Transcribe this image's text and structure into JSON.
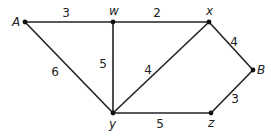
{
  "graph": {
    "type": "weighted-undirected-graph",
    "nodes": [
      {
        "id": "A",
        "label": "A",
        "x": 25,
        "y": 22,
        "lx": 12,
        "ly": 26
      },
      {
        "id": "w",
        "label": "w",
        "x": 113,
        "y": 22,
        "lx": 109,
        "ly": 15
      },
      {
        "id": "x",
        "label": "x",
        "x": 209,
        "y": 22,
        "lx": 206,
        "ly": 15
      },
      {
        "id": "B",
        "label": "B",
        "x": 253,
        "y": 70,
        "lx": 257,
        "ly": 74
      },
      {
        "id": "z",
        "label": "z",
        "x": 211,
        "y": 113,
        "lx": 208,
        "ly": 127
      },
      {
        "id": "y",
        "label": "y",
        "x": 113,
        "y": 113,
        "lx": 109,
        "ly": 128
      }
    ],
    "edges": [
      {
        "from": "A",
        "to": "w",
        "weight": "3",
        "lx": 66,
        "ly": 17
      },
      {
        "from": "w",
        "to": "x",
        "weight": "2",
        "lx": 157,
        "ly": 17
      },
      {
        "from": "x",
        "to": "B",
        "weight": "4",
        "lx": 234,
        "ly": 46
      },
      {
        "from": "B",
        "to": "z",
        "weight": "3",
        "lx": 235,
        "ly": 103
      },
      {
        "from": "y",
        "to": "z",
        "weight": "5",
        "lx": 160,
        "ly": 128
      },
      {
        "from": "A",
        "to": "y",
        "weight": "6",
        "lx": 55,
        "ly": 76
      },
      {
        "from": "w",
        "to": "y",
        "weight": "5",
        "lx": 103,
        "ly": 68
      },
      {
        "from": "x",
        "to": "y",
        "weight": "4",
        "lx": 148,
        "ly": 74
      }
    ]
  }
}
